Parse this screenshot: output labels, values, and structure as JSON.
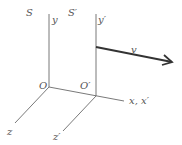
{
  "diagram": {
    "frames": [
      {
        "name": "S",
        "origin": "O",
        "y_axis": "y",
        "z_axis": "z"
      },
      {
        "name": "S′",
        "origin": "O′",
        "y_axis": "y′",
        "z_axis": "z′"
      }
    ],
    "shared_axis": "x, x′",
    "velocity": "v",
    "colors": {
      "axes": "#6a6a6a",
      "velocity": "#333333",
      "labels": "#555555"
    }
  }
}
